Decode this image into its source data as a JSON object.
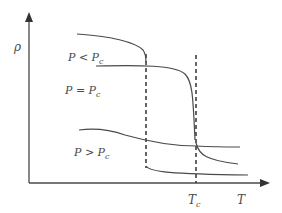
{
  "diagram": {
    "y_axis_label": "ρ",
    "x_axis_label": "T",
    "tc_label": "T",
    "tc_sub": "c",
    "curves": [
      {
        "label_main": "P < P",
        "label_sub": "c"
      },
      {
        "label_main": "P = P",
        "label_sub": "c"
      },
      {
        "label_main": "P > P",
        "label_sub": "c"
      }
    ],
    "colors": {
      "line": "#4a4a4a"
    }
  }
}
